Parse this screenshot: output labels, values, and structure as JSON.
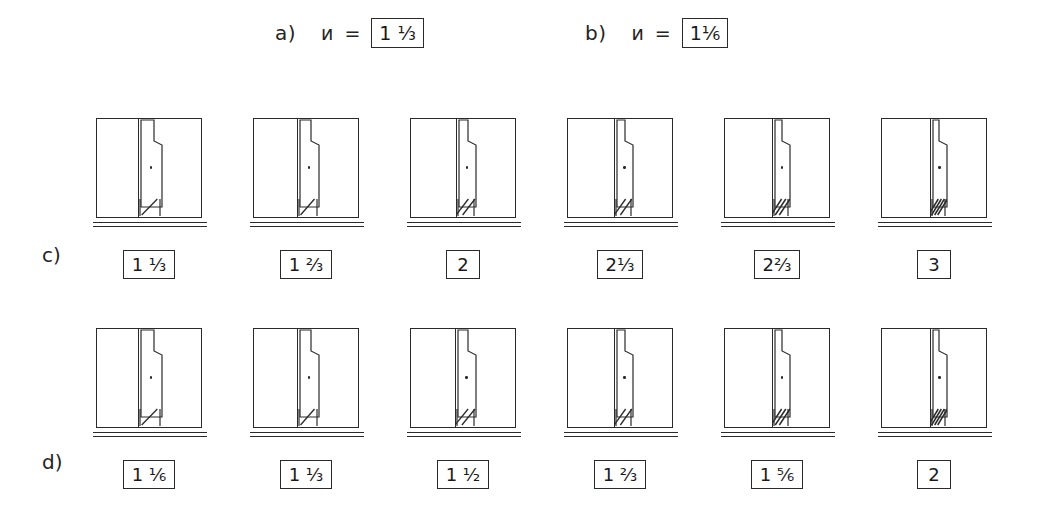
{
  "header": {
    "prompts": [
      {
        "tag": "a)",
        "variable": "и",
        "equals": "=",
        "value": "1 ⅓"
      },
      {
        "tag": "b)",
        "variable": "и",
        "equals": "=",
        "value": "1⅙"
      }
    ]
  },
  "rows": [
    {
      "tag": "c)",
      "name": "row-c",
      "cells": [
        {
          "caption": "1 ⅓",
          "leaf_width": 21,
          "leaf_offset": 44,
          "hatch_strokes": 1
        },
        {
          "caption": "1 ⅔",
          "leaf_width": 19,
          "leaf_offset": 46,
          "hatch_strokes": 1
        },
        {
          "caption": "2",
          "leaf_width": 17,
          "leaf_offset": 48,
          "hatch_strokes": 2
        },
        {
          "caption": "2⅓",
          "leaf_width": 16,
          "leaf_offset": 49,
          "hatch_strokes": 2
        },
        {
          "caption": "2⅔",
          "leaf_width": 15,
          "leaf_offset": 50,
          "hatch_strokes": 3
        },
        {
          "caption": "3",
          "leaf_width": 14,
          "leaf_offset": 51,
          "hatch_strokes": 4
        }
      ]
    },
    {
      "tag": "d)",
      "name": "row-d",
      "cells": [
        {
          "caption": "1 ⅙",
          "leaf_width": 21,
          "leaf_offset": 44,
          "hatch_strokes": 1
        },
        {
          "caption": "1 ⅓",
          "leaf_width": 19,
          "leaf_offset": 46,
          "hatch_strokes": 1
        },
        {
          "caption": "1 ½",
          "leaf_width": 18,
          "leaf_offset": 47,
          "hatch_strokes": 2
        },
        {
          "caption": "1 ⅔",
          "leaf_width": 16,
          "leaf_offset": 49,
          "hatch_strokes": 2
        },
        {
          "caption": "1 ⅚",
          "leaf_width": 15,
          "leaf_offset": 50,
          "hatch_strokes": 3
        },
        {
          "caption": "2",
          "leaf_width": 14,
          "leaf_offset": 51,
          "hatch_strokes": 4
        }
      ]
    }
  ],
  "layout": {
    "cell_x": [
      90,
      247,
      404,
      561,
      718,
      875
    ],
    "ink_color": "#2a2a2a",
    "background": "#ffffff"
  }
}
